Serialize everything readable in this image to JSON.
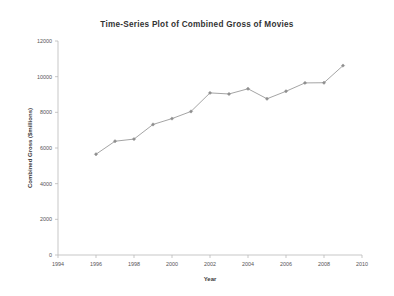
{
  "chart_data": {
    "type": "line",
    "title": "Time-Series Plot of Combined Gross of Movies",
    "xlabel": "Year",
    "ylabel": "Combined Gross ($millions)",
    "xlim": [
      1994,
      2010
    ],
    "ylim": [
      0,
      12000
    ],
    "xticks": [
      1994,
      1996,
      1998,
      2000,
      2002,
      2004,
      2006,
      2008,
      2010
    ],
    "yticks": [
      0,
      2000,
      4000,
      6000,
      8000,
      10000,
      12000
    ],
    "xtick_labels": [
      "1994",
      "1996",
      "1998",
      "2000",
      "2002",
      "2004",
      "2006",
      "2008",
      "2010"
    ],
    "ytick_labels": [
      "0",
      "2000",
      "4000",
      "6000",
      "8000",
      "10000",
      "12000"
    ],
    "grid": false,
    "legend": false,
    "marker": "diamond",
    "line_color": "#9a9a9a",
    "marker_color": "#8e8e8e",
    "background": "#ffffff",
    "x": [
      1996,
      1997,
      1998,
      1999,
      2000,
      2001,
      2002,
      2003,
      2004,
      2005,
      2006,
      2007,
      2008,
      2009
    ],
    "values": [
      5650,
      6380,
      6500,
      7320,
      7650,
      8050,
      9090,
      9030,
      9320,
      8760,
      9180,
      9650,
      9660,
      10620
    ],
    "series": [
      {
        "name": "Combined Gross",
        "values": [
          5650,
          6380,
          6500,
          7320,
          7650,
          8050,
          9090,
          9030,
          9320,
          8760,
          9180,
          9650,
          9660,
          10620
        ]
      }
    ]
  }
}
